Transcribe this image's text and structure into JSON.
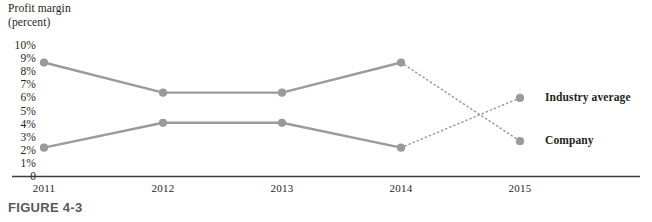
{
  "figure": {
    "caption": "FIGURE 4-3",
    "axis_title_line1": "Profit margin",
    "axis_title_line2": "(percent)"
  },
  "colors": {
    "series_line": "#9b9b9b",
    "marker": "#9a9a9a",
    "axis": "#3d3d3d",
    "text": "#231f20",
    "caption": "#58585b"
  },
  "legend": {
    "items": [
      {
        "label": "Industry average",
        "y_value": 6.0
      },
      {
        "label": "Company",
        "y_value": 2.7
      }
    ]
  },
  "chart_data": {
    "type": "line",
    "title": "Profit margin (percent)",
    "xlabel": "",
    "ylabel": "Profit margin (percent)",
    "x": [
      "2011",
      "2012",
      "2013",
      "2014",
      "2015"
    ],
    "categories": [
      "2011",
      "2012",
      "2013",
      "2014",
      "2015"
    ],
    "ylim": [
      0,
      10
    ],
    "yticks": [
      "0",
      "1%",
      "2%",
      "3%",
      "4%",
      "5%",
      "6%",
      "7%",
      "8%",
      "9%",
      "10%"
    ],
    "ytick_values": [
      0,
      1,
      2,
      3,
      4,
      5,
      6,
      7,
      8,
      9,
      10
    ],
    "grid": false,
    "legend_position": "right",
    "series": [
      {
        "name": "Industry average",
        "values": [
          8.7,
          6.4,
          6.4,
          8.7,
          2.7
        ],
        "solid_through_index": 3,
        "projected_segment": [
          3,
          4
        ],
        "projected_style": "dotted"
      },
      {
        "name": "Company",
        "values": [
          2.2,
          4.1,
          4.1,
          2.2,
          6.0
        ],
        "solid_through_index": 3,
        "projected_segment": [
          3,
          4
        ],
        "projected_style": "dotted"
      }
    ],
    "annotations": [
      "Dotted segments between 2014 and 2015 are projections",
      "Series cross between 2014 and 2015"
    ]
  }
}
